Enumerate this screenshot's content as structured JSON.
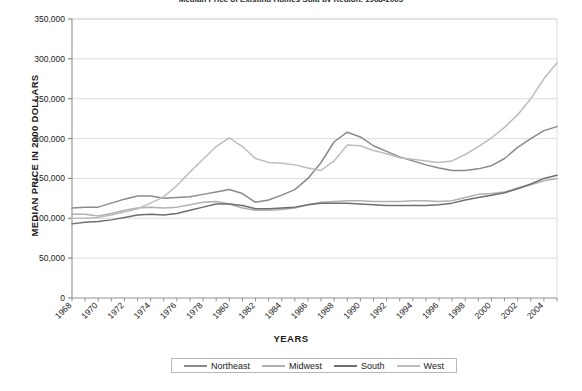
{
  "chart_data": {
    "type": "line",
    "title": "Median Price of Existing Homes Sold by Region, 1968-2005",
    "xlabel": "YEARS",
    "ylabel": "MEDIAN PRICE IN 2000 DOLLARS",
    "ylim": [
      0,
      350000
    ],
    "yticks": [
      0,
      50000,
      100000,
      150000,
      200000,
      250000,
      300000,
      350000
    ],
    "ytick_labels": [
      "0",
      "50,000",
      "100,000",
      "150,000",
      "200,000",
      "250,000",
      "300,000",
      "350,000"
    ],
    "xlim": [
      1968,
      2005
    ],
    "xticks": [
      1968,
      1970,
      1972,
      1974,
      1976,
      1978,
      1980,
      1982,
      1984,
      1986,
      1988,
      1990,
      1992,
      1994,
      1996,
      1998,
      2000,
      2002,
      2004
    ],
    "xtick_labels": [
      "1968",
      "1970",
      "1972",
      "1974",
      "1976",
      "1978",
      "1980",
      "1982",
      "1984",
      "1986",
      "1988",
      "1990",
      "1992",
      "1994",
      "1996",
      "1998",
      "2000",
      "2002",
      "2004"
    ],
    "grid": true,
    "legend_position": "bottom",
    "x": [
      1968,
      1969,
      1970,
      1971,
      1972,
      1973,
      1974,
      1975,
      1976,
      1977,
      1978,
      1979,
      1980,
      1981,
      1982,
      1983,
      1984,
      1985,
      1986,
      1987,
      1988,
      1989,
      1990,
      1991,
      1992,
      1993,
      1994,
      1995,
      1996,
      1997,
      1998,
      1999,
      2000,
      2001,
      2002,
      2003,
      2004,
      2005
    ],
    "series": [
      {
        "name": "Northeast",
        "color": "#8a8a8a",
        "values": [
          113000,
          114000,
          114000,
          119000,
          124000,
          128000,
          128000,
          125000,
          126000,
          127000,
          130000,
          133000,
          136000,
          131000,
          120000,
          123000,
          129000,
          136000,
          150000,
          170000,
          196000,
          208000,
          202000,
          191000,
          184000,
          177000,
          172000,
          167000,
          163000,
          160000,
          160000,
          162000,
          166000,
          175000,
          189000,
          200000,
          210000,
          215000
        ]
      },
      {
        "name": "Midwest",
        "color": "#b0b0b0",
        "values": [
          105000,
          105000,
          103000,
          106000,
          110000,
          113000,
          114000,
          113000,
          114000,
          117000,
          120000,
          121000,
          118000,
          113000,
          110000,
          110000,
          111000,
          113000,
          117000,
          120000,
          121000,
          122000,
          122000,
          121000,
          121000,
          121000,
          122000,
          122000,
          121000,
          122000,
          126000,
          130000,
          131000,
          133000,
          138000,
          142000,
          147000,
          150000
        ]
      },
      {
        "name": "South",
        "color": "#6e6e6e",
        "values": [
          93000,
          95000,
          96000,
          98000,
          101000,
          104000,
          105000,
          104000,
          106000,
          110000,
          114000,
          118000,
          118000,
          116000,
          112000,
          112000,
          113000,
          114000,
          117000,
          119000,
          119000,
          119000,
          118000,
          117000,
          116000,
          116000,
          116000,
          116000,
          117000,
          119000,
          123000,
          126000,
          129000,
          132000,
          137000,
          143000,
          150000,
          154000
        ]
      },
      {
        "name": "West",
        "color": "#bdbdbd",
        "values": [
          100000,
          100000,
          101000,
          104000,
          108000,
          112000,
          119000,
          127000,
          141000,
          158000,
          174000,
          190000,
          201000,
          190000,
          175000,
          170000,
          169000,
          167000,
          163000,
          160000,
          172000,
          192000,
          191000,
          185000,
          181000,
          176000,
          174000,
          172000,
          170000,
          172000,
          180000,
          190000,
          201000,
          214000,
          230000,
          250000,
          275000,
          295000
        ]
      }
    ]
  },
  "legend": {
    "items": [
      {
        "label": "Northeast"
      },
      {
        "label": "Midwest"
      },
      {
        "label": "South"
      },
      {
        "label": "West"
      }
    ]
  }
}
